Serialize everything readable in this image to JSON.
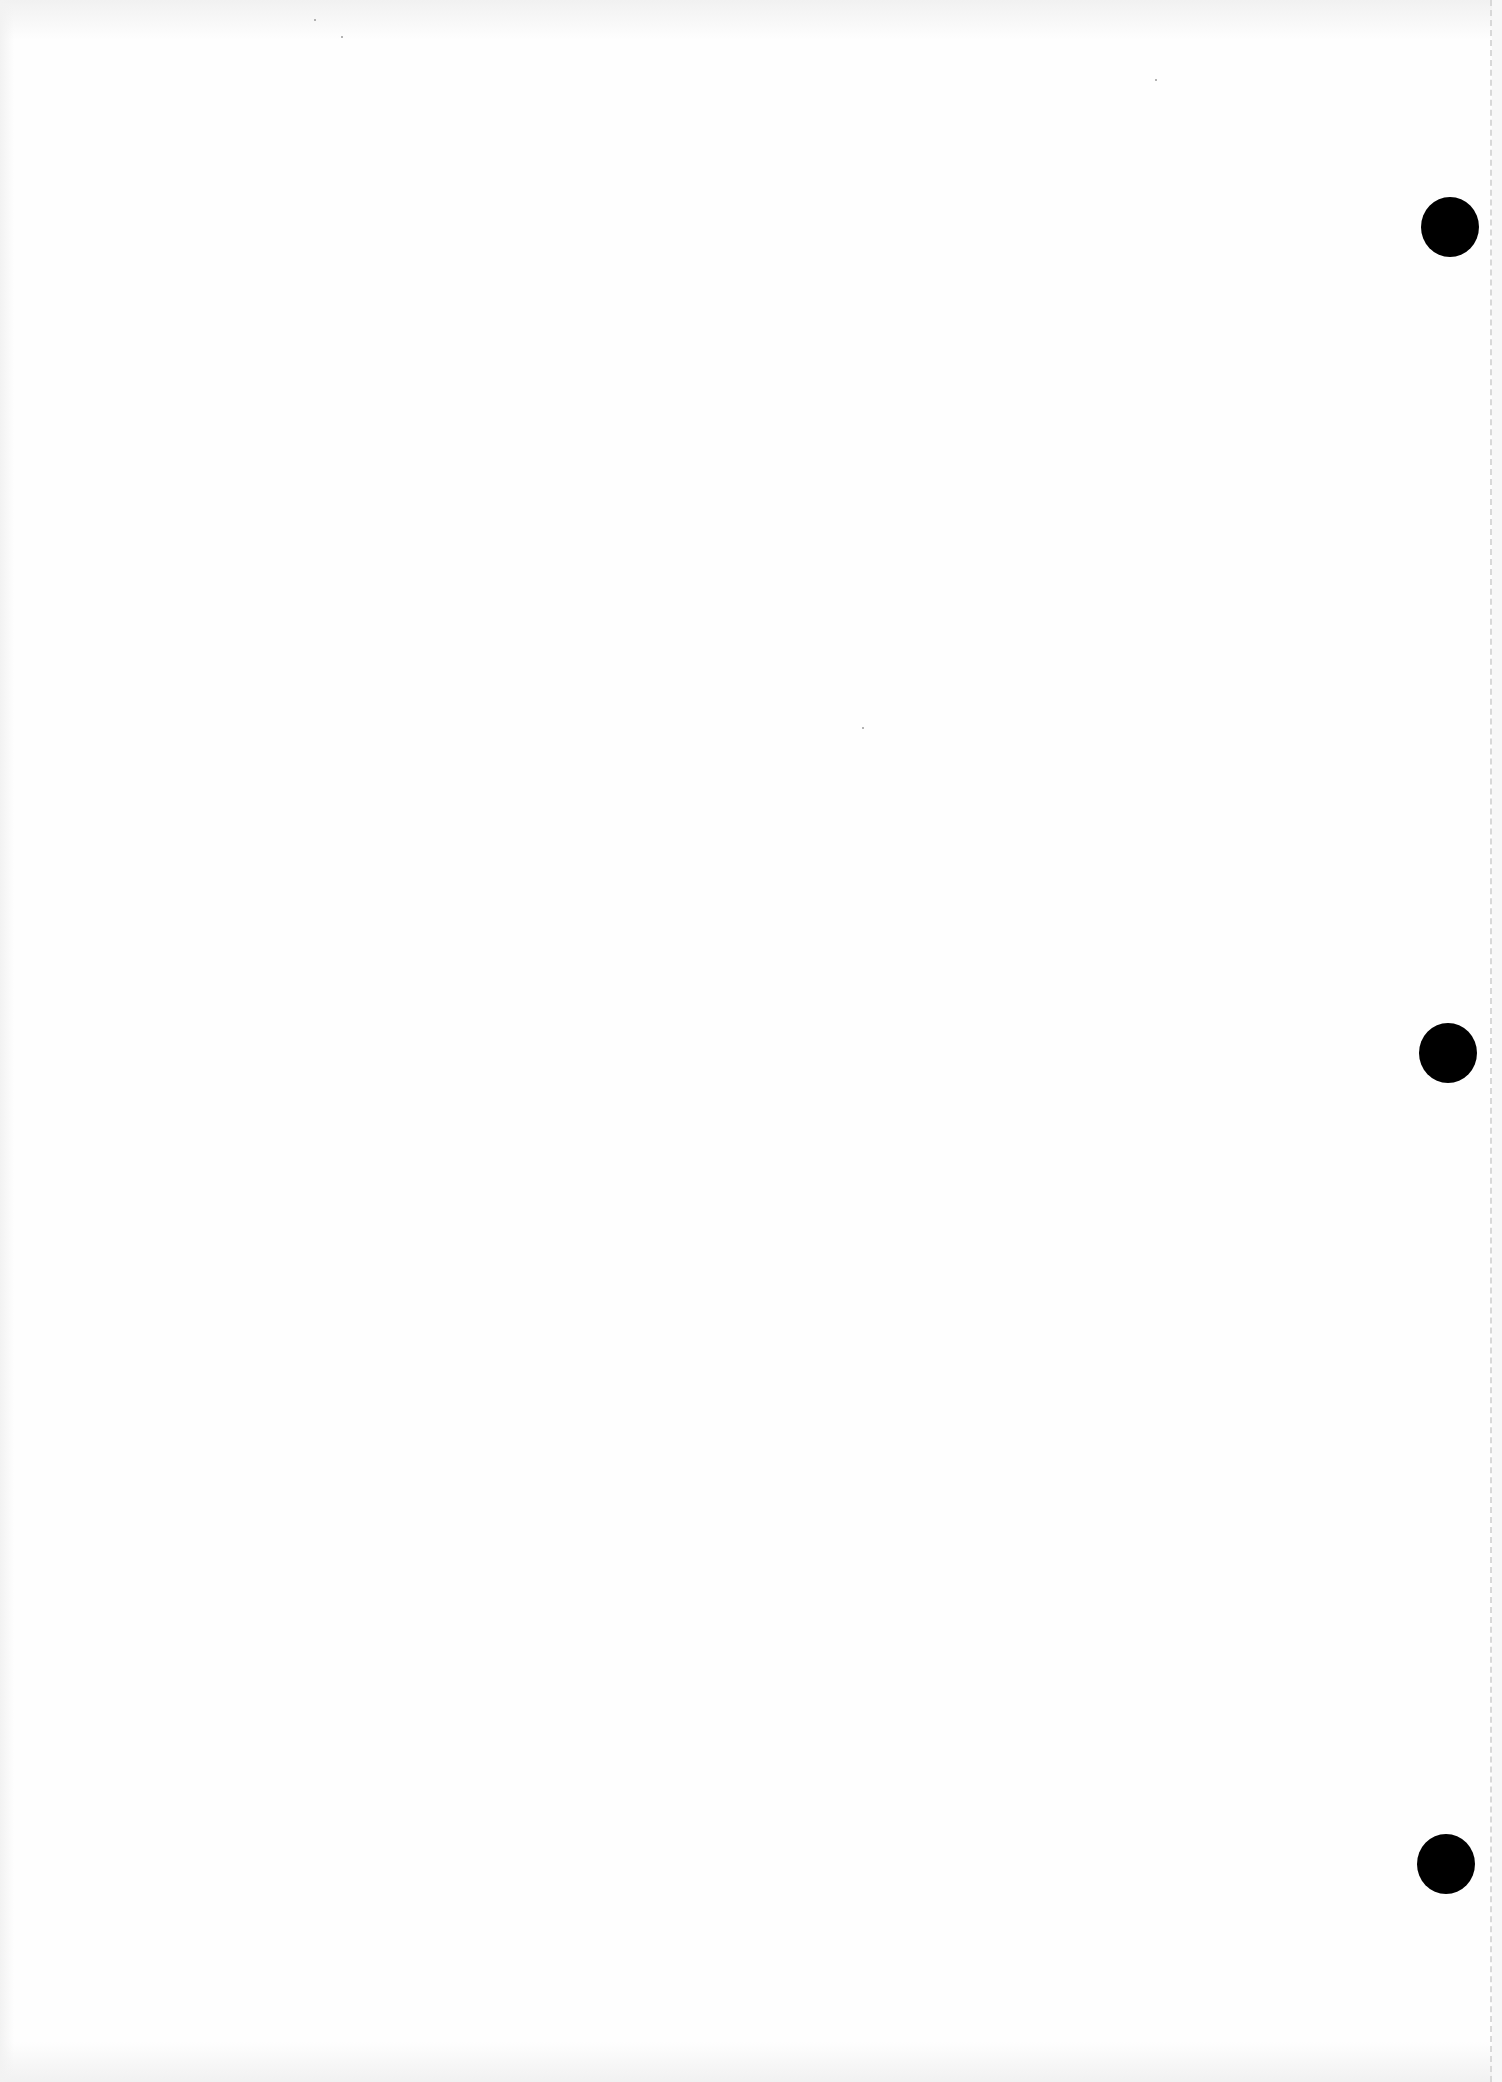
{
  "document": {
    "type": "blank scanned sheet",
    "text": "",
    "background_color": "#fefefe",
    "punch_holes": [
      {
        "cx": 1450,
        "cy": 227,
        "diameter": 58
      },
      {
        "cx": 1448,
        "cy": 1053,
        "diameter": 58
      },
      {
        "cx": 1446,
        "cy": 1864,
        "diameter": 58
      }
    ],
    "hole_color": "#000000",
    "edge_line": {
      "style": "dashed",
      "x": 1491,
      "color": "#d8d8d8"
    }
  }
}
